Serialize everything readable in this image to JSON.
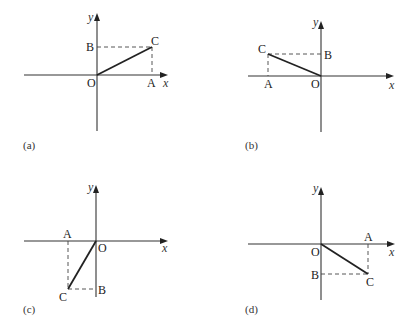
{
  "panels": [
    {
      "id": "a",
      "caption": "(a)",
      "labels": {
        "O": "O",
        "A": "A",
        "B": "B",
        "C": "C",
        "x": "x",
        "y": "y"
      }
    },
    {
      "id": "b",
      "caption": "(b)",
      "labels": {
        "O": "O",
        "A": "A",
        "B": "B",
        "C": "C",
        "x": "x",
        "y": "y"
      }
    },
    {
      "id": "c",
      "caption": "(c)",
      "labels": {
        "O": "O",
        "A": "A",
        "B": "B",
        "C": "C",
        "x": "x",
        "y": "y"
      }
    },
    {
      "id": "d",
      "caption": "(d)",
      "labels": {
        "O": "O",
        "A": "A",
        "B": "B",
        "C": "C",
        "x": "x",
        "y": "y"
      }
    }
  ]
}
